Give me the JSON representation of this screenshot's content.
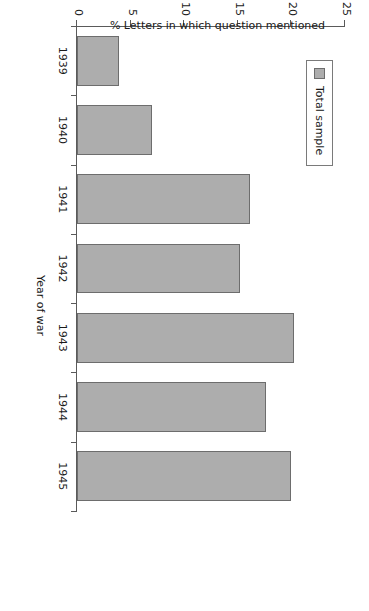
{
  "chart_data": {
    "type": "bar",
    "orientation": "vertical",
    "title": "",
    "categories": [
      "1939",
      "1940",
      "1941",
      "1942",
      "1943",
      "1944",
      "1945"
    ],
    "values": [
      3.9,
      7.0,
      16.1,
      15.2,
      20.2,
      17.6,
      20.0
    ],
    "series": [
      {
        "name": "Total sample",
        "values": [
          3.9,
          7.0,
          16.1,
          15.2,
          20.2,
          17.6,
          20.0
        ],
        "color": "#adadad"
      }
    ],
    "xlabel": "Year of war",
    "ylabel": "% Letters in which question mentioned",
    "ylim": [
      0,
      25
    ],
    "yticks": [
      0,
      5,
      10,
      15,
      20,
      25
    ],
    "ytick_labels": [
      "0",
      "5",
      "10",
      "15",
      "20",
      "25"
    ],
    "xtick_labels": [
      "1939",
      "1940",
      "1941",
      "1942",
      "1943",
      "1944",
      "1945"
    ],
    "grid": false,
    "legend": {
      "position": "upper-left",
      "entries": [
        {
          "label": "Total sample",
          "swatch": "legend-swatch-total-sample",
          "color": "#adadad"
        }
      ]
    },
    "bar_color": "#adadad",
    "bar_edge_color": "#6d6d6d",
    "axis_color": "#5a5a5a",
    "background": "#ffffff",
    "page_rotation_degrees": 90
  }
}
